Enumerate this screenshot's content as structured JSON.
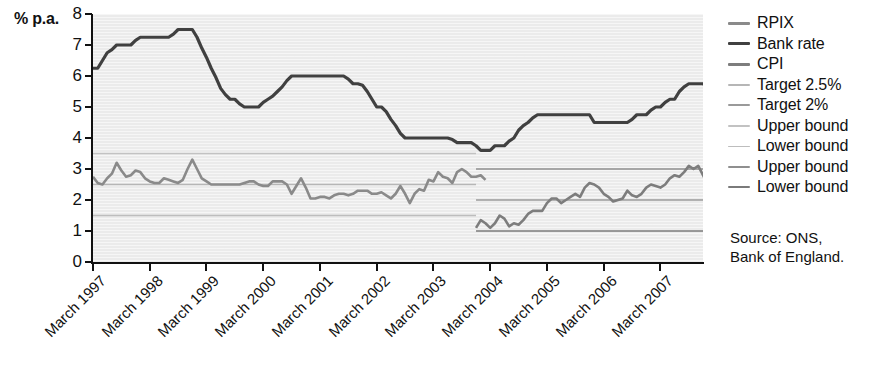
{
  "axes": {
    "y_unit_label": "% p.a.",
    "y_ticks": [
      "8",
      "7",
      "6",
      "5",
      "4",
      "3",
      "2",
      "1",
      "0"
    ],
    "x_ticks": [
      "March 1997",
      "March 1998",
      "March 1999",
      "March 2000",
      "March 2001",
      "March 2002",
      "March 2003",
      "March 2004",
      "March 2005",
      "March 2006",
      "March 2007"
    ]
  },
  "legend": {
    "items": [
      {
        "label": "RPIX",
        "color": "#8a8a8a",
        "width": 3.2
      },
      {
        "label": "Bank rate",
        "color": "#404040",
        "width": 3.4
      },
      {
        "label": "CPI",
        "color": "#7d7d7d",
        "width": 3.2
      },
      {
        "label": "Target 2.5%",
        "color": "#b6b6b6",
        "width": 1.6
      },
      {
        "label": "Target 2%",
        "color": "#9a9a9a",
        "width": 1.8
      },
      {
        "label": "Upper bound",
        "color": "#c2c2c2",
        "width": 1.5
      },
      {
        "label": "Lower bound",
        "color": "#bdbdbd",
        "width": 1.5
      },
      {
        "label": "Upper bound",
        "color": "#8f8f8f",
        "width": 1.6
      },
      {
        "label": "Lower bound",
        "color": "#7a7a7a",
        "width": 1.7
      }
    ]
  },
  "source_note": "Source: ONS,\nBank of England.",
  "colors": {
    "plot_background": "#ebebeb",
    "axis": "#111111",
    "rpix": "#8a8a8a",
    "bank_rate": "#404040",
    "cpi": "#7d7d7d",
    "target_25": "#b6b6b6",
    "target_2": "#9a9a9a",
    "rpix_upper": "#c2c2c2",
    "rpix_lower": "#bdbdbd",
    "cpi_upper": "#8f8f8f",
    "cpi_lower": "#7a7a7a"
  },
  "chart_data": {
    "type": "line",
    "title": "",
    "xlabel": "",
    "ylabel": "% p.a.",
    "ylim": [
      0,
      8
    ],
    "xlim": [
      "1997-03",
      "2007-12"
    ],
    "grid": false,
    "legend_position": "right",
    "x_tick_labels": [
      "March 1997",
      "March 1998",
      "March 1999",
      "March 2000",
      "March 2001",
      "March 2002",
      "March 2003",
      "March 2004",
      "March 2005",
      "March 2006",
      "March 2007"
    ],
    "y_tick_values": [
      0,
      1,
      2,
      3,
      4,
      5,
      6,
      7,
      8
    ],
    "series": [
      {
        "name": "Bank rate",
        "color": "#404040",
        "x_start": "1997-03",
        "x_step_months": 1,
        "values": [
          6.25,
          6.25,
          6.5,
          6.75,
          6.85,
          7.0,
          7.0,
          7.0,
          7.0,
          7.15,
          7.25,
          7.25,
          7.25,
          7.25,
          7.25,
          7.25,
          7.25,
          7.35,
          7.5,
          7.5,
          7.5,
          7.5,
          7.25,
          6.9,
          6.6,
          6.25,
          5.95,
          5.6,
          5.4,
          5.25,
          5.25,
          5.1,
          5.0,
          5.0,
          5.0,
          5.0,
          5.15,
          5.25,
          5.35,
          5.5,
          5.65,
          5.85,
          6.0,
          6.0,
          6.0,
          6.0,
          6.0,
          6.0,
          6.0,
          6.0,
          6.0,
          6.0,
          6.0,
          6.0,
          5.9,
          5.75,
          5.75,
          5.7,
          5.5,
          5.25,
          5.0,
          5.0,
          4.85,
          4.6,
          4.4,
          4.15,
          4.0,
          4.0,
          4.0,
          4.0,
          4.0,
          4.0,
          4.0,
          4.0,
          4.0,
          4.0,
          3.95,
          3.85,
          3.85,
          3.85,
          3.85,
          3.75,
          3.6,
          3.6,
          3.6,
          3.75,
          3.75,
          3.75,
          3.9,
          4.0,
          4.25,
          4.4,
          4.5,
          4.65,
          4.75,
          4.75,
          4.75,
          4.75,
          4.75,
          4.75,
          4.75,
          4.75,
          4.75,
          4.75,
          4.75,
          4.75,
          4.5,
          4.5,
          4.5,
          4.5,
          4.5,
          4.5,
          4.5,
          4.5,
          4.6,
          4.75,
          4.75,
          4.75,
          4.9,
          5.0,
          5.0,
          5.15,
          5.25,
          5.25,
          5.5,
          5.65,
          5.75,
          5.75,
          5.75,
          5.75,
          5.65,
          5.5,
          5.5
        ]
      },
      {
        "name": "RPIX",
        "color": "#8a8a8a",
        "x_start": "1997-03",
        "x_end": "2003-12",
        "x_step_months": 1,
        "values": [
          2.75,
          2.55,
          2.5,
          2.7,
          2.85,
          3.2,
          2.95,
          2.75,
          2.8,
          2.95,
          2.9,
          2.7,
          2.6,
          2.55,
          2.55,
          2.7,
          2.65,
          2.6,
          2.55,
          2.65,
          3.0,
          3.3,
          3.0,
          2.7,
          2.6,
          2.5,
          2.5,
          2.5,
          2.5,
          2.5,
          2.5,
          2.5,
          2.55,
          2.6,
          2.6,
          2.5,
          2.45,
          2.45,
          2.6,
          2.6,
          2.6,
          2.5,
          2.2,
          2.45,
          2.7,
          2.4,
          2.05,
          2.05,
          2.1,
          2.1,
          2.05,
          2.15,
          2.2,
          2.2,
          2.15,
          2.2,
          2.3,
          2.3,
          2.3,
          2.2,
          2.2,
          2.25,
          2.15,
          2.05,
          2.2,
          2.45,
          2.2,
          1.9,
          2.2,
          2.35,
          2.3,
          2.65,
          2.6,
          2.9,
          2.75,
          2.7,
          2.55,
          2.9,
          3.0,
          2.9,
          2.75,
          2.75,
          2.8,
          2.65
        ]
      },
      {
        "name": "CPI",
        "color": "#7d7d7d",
        "x_start": "2003-12",
        "x_step_months": 1,
        "values": [
          1.1,
          1.35,
          1.25,
          1.1,
          1.25,
          1.5,
          1.4,
          1.15,
          1.25,
          1.2,
          1.35,
          1.55,
          1.65,
          1.65,
          1.65,
          1.9,
          2.05,
          2.05,
          1.9,
          2.0,
          2.1,
          2.2,
          2.1,
          2.4,
          2.55,
          2.5,
          2.4,
          2.2,
          2.1,
          1.95,
          2.0,
          2.05,
          2.3,
          2.15,
          2.1,
          2.2,
          2.4,
          2.5,
          2.45,
          2.4,
          2.5,
          2.7,
          2.8,
          2.75,
          2.9,
          3.1,
          3.0,
          3.1,
          2.8,
          2.5,
          2.4,
          2.4,
          2.5,
          2.1,
          2.4,
          2.5
        ]
      },
      {
        "name": "Target 2.5%",
        "type": "hline",
        "color": "#b6b6b6",
        "value": 2.5,
        "x_start": "1997-03",
        "x_end": "2003-12"
      },
      {
        "name": "Upper bound",
        "type": "hline",
        "color": "#c2c2c2",
        "value": 3.5,
        "x_start": "1997-03",
        "x_end": "2003-12"
      },
      {
        "name": "Lower bound",
        "type": "hline",
        "color": "#bdbdbd",
        "value": 1.5,
        "x_start": "1997-03",
        "x_end": "2003-12"
      },
      {
        "name": "Target 2%",
        "type": "hline",
        "color": "#9a9a9a",
        "value": 2.0,
        "x_start": "2003-12",
        "x_end": "2007-12"
      },
      {
        "name": "Upper bound",
        "type": "hline",
        "color": "#8f8f8f",
        "value": 3.0,
        "x_start": "2003-12",
        "x_end": "2007-12"
      },
      {
        "name": "Lower bound",
        "type": "hline",
        "color": "#7a7a7a",
        "value": 1.0,
        "x_start": "2003-12",
        "x_end": "2007-12"
      }
    ]
  }
}
